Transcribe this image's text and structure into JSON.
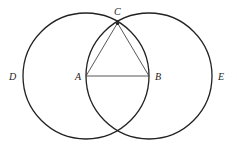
{
  "diagram": {
    "title": "",
    "colors": {
      "stroke": "#222222",
      "background": "#ffffff"
    },
    "points": {
      "A": {
        "label": "A",
        "x": 86,
        "y": 76
      },
      "B": {
        "label": "B",
        "x": 149,
        "y": 76
      },
      "C": {
        "label": "C",
        "x": 117.5,
        "y": 23
      },
      "D": {
        "label": "D"
      },
      "E": {
        "label": "E"
      }
    },
    "circles": [
      {
        "name": "circle-BCD",
        "center": "A",
        "radius": 63
      },
      {
        "name": "circle-ACE",
        "center": "B",
        "radius": 63
      }
    ],
    "triangle": [
      "A",
      "B",
      "C"
    ]
  }
}
